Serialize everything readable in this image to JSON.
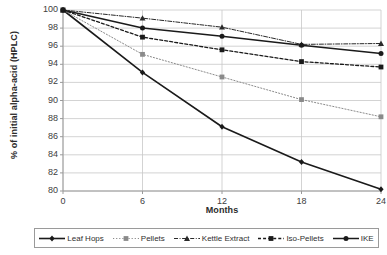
{
  "chart_data": {
    "type": "line",
    "title": "",
    "xlabel": "Months",
    "ylabel": "% of initial alpha-acid (HPLC)",
    "x": [
      0,
      6,
      12,
      18,
      24
    ],
    "xticklabels": [
      "0",
      "6",
      "12",
      "18",
      "24"
    ],
    "yticklabels": [
      "80",
      "82",
      "84",
      "86",
      "88",
      "90",
      "92",
      "94",
      "96",
      "98",
      "100"
    ],
    "xlim": [
      0,
      24
    ],
    "ylim": [
      80,
      100
    ],
    "grid": "horizontal-and-vertical",
    "legend_position": "bottom",
    "series": [
      {
        "name": "Leaf Hops",
        "values": [
          100,
          93.1,
          87.1,
          83.2,
          80.2
        ],
        "marker": "diamond",
        "linestyle": "solid",
        "color": "#1a1a1a",
        "linewidth": 1.6
      },
      {
        "name": "Pellets",
        "values": [
          100,
          95.1,
          92.6,
          90.1,
          88.2
        ],
        "marker": "square",
        "linestyle": "dotted",
        "color": "#8a8a8a",
        "linewidth": 1.0
      },
      {
        "name": "Kettle Extract",
        "values": [
          100,
          99.1,
          98.1,
          96.2,
          96.3
        ],
        "marker": "triangle",
        "linestyle": "dashdot",
        "color": "#2a2a2a",
        "linewidth": 1.0
      },
      {
        "name": "Iso-Pellets",
        "values": [
          100,
          97.0,
          95.6,
          94.3,
          93.7
        ],
        "marker": "square",
        "linestyle": "dashed",
        "color": "#1a1a1a",
        "linewidth": 1.3
      },
      {
        "name": "IKE",
        "values": [
          100,
          98.0,
          97.1,
          96.1,
          95.2
        ],
        "marker": "circle",
        "linestyle": "solid",
        "color": "#1a1a1a",
        "linewidth": 1.5
      }
    ],
    "axis_color": "#9a9a9a",
    "grid_color": "#c8c8c8"
  }
}
